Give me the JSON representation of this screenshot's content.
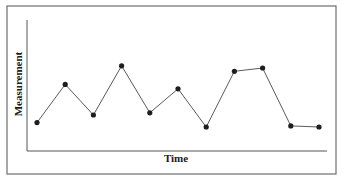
{
  "chart_data": {
    "type": "line",
    "title": "",
    "xlabel": "Time",
    "ylabel": "Measurement",
    "x": [
      1,
      2,
      3,
      4,
      5,
      6,
      7,
      8,
      9,
      10,
      11
    ],
    "series": [
      {
        "name": "Measurement",
        "values": [
          2.6,
          6.1,
          3.3,
          7.8,
          3.5,
          5.7,
          2.2,
          7.3,
          7.6,
          2.3,
          2.2
        ],
        "marker": "circle",
        "color": "#1e1e1e"
      }
    ],
    "xlim": [
      0,
      12
    ],
    "ylim": [
      0,
      12
    ],
    "xticks": [],
    "yticks": [],
    "grid": false,
    "legend": null
  },
  "colors": {
    "line": "#5a5a5a",
    "marker": "#1e1e1e",
    "axis": "#555555",
    "frame": "#6e6e6e"
  }
}
